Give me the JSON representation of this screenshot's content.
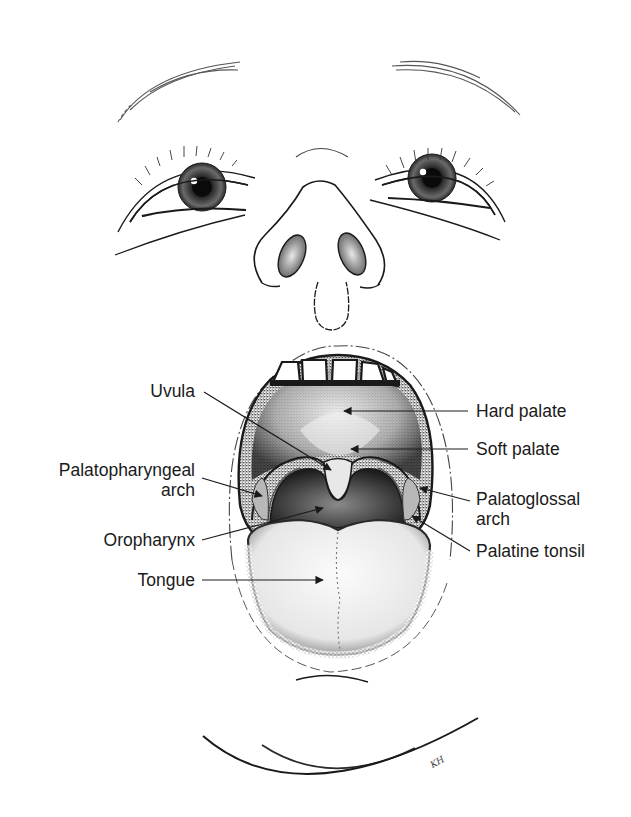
{
  "diagram": {
    "colors": {
      "ink": "#1a1a1a",
      "stipple_dark": "#2a2a2a",
      "stipple_mid": "#6a6a6a",
      "tonsil_fill": "#b8b8b8",
      "background": "#ffffff"
    },
    "labels_left": [
      {
        "id": "uvula",
        "lines": [
          "Uvula"
        ]
      },
      {
        "id": "palatopharyngeal-arch",
        "lines": [
          "Palatopharyngeal",
          "arch"
        ]
      },
      {
        "id": "oropharynx",
        "lines": [
          "Oropharynx"
        ]
      },
      {
        "id": "tongue",
        "lines": [
          "Tongue"
        ]
      }
    ],
    "labels_right": [
      {
        "id": "hard-palate",
        "lines": [
          "Hard palate"
        ]
      },
      {
        "id": "soft-palate",
        "lines": [
          "Soft palate"
        ]
      },
      {
        "id": "palatoglossal-arch",
        "lines": [
          "Palatoglossal",
          "arch"
        ]
      },
      {
        "id": "palatine-tonsil",
        "lines": [
          "Palatine tonsil"
        ]
      }
    ],
    "artist_signature": "KH"
  }
}
